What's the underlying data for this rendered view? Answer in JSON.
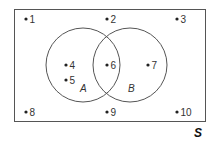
{
  "diagram": {
    "type": "venn",
    "universe": {
      "label": "S",
      "x": 14,
      "y": 9,
      "width": 191,
      "height": 112
    },
    "sets": [
      {
        "label": "A",
        "cx": 83,
        "cy": 65,
        "r": 37,
        "label_x": 80,
        "label_y": 92
      },
      {
        "label": "B",
        "cx": 130,
        "cy": 65,
        "r": 37,
        "label_x": 128,
        "label_y": 92
      }
    ],
    "points": [
      {
        "label": "1",
        "x": 26,
        "y": 19,
        "region": "outside"
      },
      {
        "label": "2",
        "x": 107,
        "y": 19,
        "region": "outside"
      },
      {
        "label": "3",
        "x": 177,
        "y": 19,
        "region": "outside"
      },
      {
        "label": "4",
        "x": 66,
        "y": 65,
        "region": "A only"
      },
      {
        "label": "5",
        "x": 66,
        "y": 80,
        "region": "A only"
      },
      {
        "label": "6",
        "x": 107,
        "y": 65,
        "region": "A and B"
      },
      {
        "label": "7",
        "x": 148,
        "y": 65,
        "region": "B only"
      },
      {
        "label": "8",
        "x": 26,
        "y": 112,
        "region": "outside"
      },
      {
        "label": "9",
        "x": 107,
        "y": 112,
        "region": "outside"
      },
      {
        "label": "10",
        "x": 177,
        "y": 112,
        "region": "outside"
      }
    ],
    "colors": {
      "stroke": "#555555",
      "dot": "#222222",
      "text": "#333333"
    }
  }
}
